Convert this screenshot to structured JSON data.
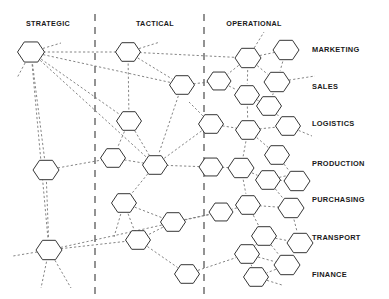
{
  "diagram": {
    "type": "hexagon-network-matrix",
    "title_visible": false,
    "background_color": "#ffffff",
    "node_stroke_color": "#2b2b2b",
    "node_fill_color": "#ffffff",
    "edge_color": "#6e6e6e",
    "divider_color": "#3a3a3a",
    "label_color": "#1a1a1a",
    "column_labels": [
      {
        "id": "strategic",
        "text": "STRATEGIC",
        "x": 48,
        "y": 26
      },
      {
        "id": "tactical",
        "text": "TACTICAL",
        "x": 155,
        "y": 26
      },
      {
        "id": "operational",
        "text": "OPERATIONAL",
        "x": 254,
        "y": 26
      }
    ],
    "row_labels": [
      {
        "id": "marketing",
        "text": "MARKETING",
        "x": 312,
        "y": 52
      },
      {
        "id": "sales",
        "text": "SALES",
        "x": 312,
        "y": 89
      },
      {
        "id": "logistics",
        "text": "LOGISTICS",
        "x": 312,
        "y": 126
      },
      {
        "id": "production",
        "text": "PRODUCTION",
        "x": 312,
        "y": 166
      },
      {
        "id": "purchasing",
        "text": "PURCHASING",
        "x": 312,
        "y": 202
      },
      {
        "id": "transport",
        "text": "TRANSPORT",
        "x": 312,
        "y": 240
      },
      {
        "id": "finance",
        "text": "FINANCE",
        "x": 312,
        "y": 277
      }
    ],
    "dividers": [
      {
        "id": "divider-strategic-tactical",
        "x": 95,
        "y1": 14,
        "y2": 296
      },
      {
        "id": "divider-tactical-operational",
        "x": 204,
        "y1": 14,
        "y2": 296
      }
    ],
    "nodes": [
      {
        "id": "n1",
        "x": 31,
        "y": 52,
        "r": 13.5,
        "zone": "strategic"
      },
      {
        "id": "n2",
        "x": 46,
        "y": 170,
        "r": 13.0,
        "zone": "strategic"
      },
      {
        "id": "n3",
        "x": 49,
        "y": 250,
        "r": 13.0,
        "zone": "strategic"
      },
      {
        "id": "n4",
        "x": 128,
        "y": 52,
        "r": 12.5,
        "zone": "tactical"
      },
      {
        "id": "n5",
        "x": 182,
        "y": 85,
        "r": 12.5,
        "zone": "tactical"
      },
      {
        "id": "n6",
        "x": 129,
        "y": 121,
        "r": 12.5,
        "zone": "tactical"
      },
      {
        "id": "n7",
        "x": 113,
        "y": 158,
        "r": 12.5,
        "zone": "tactical"
      },
      {
        "id": "n8",
        "x": 155,
        "y": 165,
        "r": 12.5,
        "zone": "tactical"
      },
      {
        "id": "n9",
        "x": 124,
        "y": 203,
        "r": 12.5,
        "zone": "tactical"
      },
      {
        "id": "n10",
        "x": 173,
        "y": 222,
        "r": 12.5,
        "zone": "tactical"
      },
      {
        "id": "n11",
        "x": 138,
        "y": 240,
        "r": 12.5,
        "zone": "tactical"
      },
      {
        "id": "n12",
        "x": 187,
        "y": 274,
        "r": 12.5,
        "zone": "tactical"
      },
      {
        "id": "n13",
        "x": 248,
        "y": 58,
        "r": 13.0,
        "zone": "operational"
      },
      {
        "id": "n14",
        "x": 286,
        "y": 50,
        "r": 13.0,
        "zone": "operational"
      },
      {
        "id": "n15",
        "x": 219,
        "y": 81,
        "r": 12.0,
        "zone": "operational"
      },
      {
        "id": "n16",
        "x": 277,
        "y": 82,
        "r": 13.0,
        "zone": "operational"
      },
      {
        "id": "n17",
        "x": 247,
        "y": 95,
        "r": 12.5,
        "zone": "operational"
      },
      {
        "id": "n18",
        "x": 269,
        "y": 106,
        "r": 12.5,
        "zone": "operational"
      },
      {
        "id": "n19",
        "x": 211,
        "y": 124,
        "r": 12.5,
        "zone": "operational"
      },
      {
        "id": "n20",
        "x": 248,
        "y": 130,
        "r": 12.5,
        "zone": "operational"
      },
      {
        "id": "n21",
        "x": 288,
        "y": 126,
        "r": 12.5,
        "zone": "operational"
      },
      {
        "id": "n22",
        "x": 277,
        "y": 155,
        "r": 12.5,
        "zone": "operational"
      },
      {
        "id": "n23",
        "x": 211,
        "y": 167,
        "r": 12.0,
        "zone": "operational"
      },
      {
        "id": "n24",
        "x": 241,
        "y": 168,
        "r": 13.0,
        "zone": "operational"
      },
      {
        "id": "n25",
        "x": 268,
        "y": 180,
        "r": 12.5,
        "zone": "operational"
      },
      {
        "id": "n26",
        "x": 297,
        "y": 181,
        "r": 13.0,
        "zone": "operational"
      },
      {
        "id": "n27",
        "x": 248,
        "y": 205,
        "r": 12.5,
        "zone": "operational"
      },
      {
        "id": "n28",
        "x": 291,
        "y": 208,
        "r": 13.0,
        "zone": "operational"
      },
      {
        "id": "n29",
        "x": 221,
        "y": 212,
        "r": 12.0,
        "zone": "operational"
      },
      {
        "id": "n30",
        "x": 264,
        "y": 236,
        "r": 12.5,
        "zone": "operational"
      },
      {
        "id": "n31",
        "x": 300,
        "y": 243,
        "r": 13.0,
        "zone": "operational"
      },
      {
        "id": "n32",
        "x": 247,
        "y": 254,
        "r": 12.5,
        "zone": "operational"
      },
      {
        "id": "n33",
        "x": 287,
        "y": 265,
        "r": 13.0,
        "zone": "operational"
      },
      {
        "id": "n34",
        "x": 256,
        "y": 277,
        "r": 12.5,
        "zone": "operational"
      }
    ],
    "edges": [
      [
        "n1",
        "n4"
      ],
      [
        "n1",
        "n6"
      ],
      [
        "n1",
        "n2"
      ],
      [
        "n1",
        "n3"
      ],
      [
        "n1",
        "n8"
      ],
      [
        "n1",
        "n5"
      ],
      [
        "n4",
        "n6"
      ],
      [
        "n4",
        "n5"
      ],
      [
        "n4",
        "n13"
      ],
      [
        "n5",
        "n8"
      ],
      [
        "n5",
        "n15"
      ],
      [
        "n6",
        "n7"
      ],
      [
        "n6",
        "n8"
      ],
      [
        "n2",
        "n7"
      ],
      [
        "n2",
        "n3"
      ],
      [
        "n7",
        "n8"
      ],
      [
        "n8",
        "n9"
      ],
      [
        "n8",
        "n19"
      ],
      [
        "n8",
        "n23"
      ],
      [
        "n9",
        "n11"
      ],
      [
        "n9",
        "n10"
      ],
      [
        "n10",
        "n11"
      ],
      [
        "n10",
        "n29"
      ],
      [
        "n3",
        "n11"
      ],
      [
        "n3",
        "n29"
      ],
      [
        "n11",
        "n12"
      ],
      [
        "n12",
        "n32"
      ],
      [
        "n13",
        "n14"
      ],
      [
        "n13",
        "n15"
      ],
      [
        "n13",
        "n16"
      ],
      [
        "n13",
        "n17"
      ],
      [
        "n14",
        "n16"
      ],
      [
        "n15",
        "n17"
      ],
      [
        "n16",
        "n18"
      ],
      [
        "n17",
        "n18"
      ],
      [
        "n17",
        "n20"
      ],
      [
        "n18",
        "n21"
      ],
      [
        "n19",
        "n20"
      ],
      [
        "n20",
        "n21"
      ],
      [
        "n20",
        "n22"
      ],
      [
        "n20",
        "n24"
      ],
      [
        "n22",
        "n26"
      ],
      [
        "n23",
        "n24"
      ],
      [
        "n24",
        "n25"
      ],
      [
        "n24",
        "n27"
      ],
      [
        "n25",
        "n26"
      ],
      [
        "n25",
        "n28"
      ],
      [
        "n27",
        "n28"
      ],
      [
        "n27",
        "n29"
      ],
      [
        "n27",
        "n30"
      ],
      [
        "n30",
        "n31"
      ],
      [
        "n30",
        "n32"
      ],
      [
        "n30",
        "n33"
      ],
      [
        "n32",
        "n33"
      ],
      [
        "n32",
        "n34"
      ],
      [
        "n33",
        "n34"
      ],
      [
        "n28",
        "n31"
      ]
    ],
    "stub_edges": [
      {
        "id": "s1",
        "from": "n1",
        "dx": 30,
        "dy": -9
      },
      {
        "id": "s2",
        "from": "n1",
        "dx": -14,
        "dy": 26
      },
      {
        "id": "s3",
        "from": "n3",
        "dx": -36,
        "dy": 6
      },
      {
        "id": "s4",
        "from": "n3",
        "dx": -8,
        "dy": 38
      },
      {
        "id": "s5",
        "from": "n3",
        "dx": 22,
        "dy": 38
      },
      {
        "id": "s6",
        "from": "n4",
        "dx": 32,
        "dy": -10
      },
      {
        "id": "s7",
        "from": "n9",
        "dx": -10,
        "dy": 34
      },
      {
        "id": "s8",
        "from": "n13",
        "dx": 16,
        "dy": -26
      },
      {
        "id": "s9",
        "from": "n16",
        "dx": 38,
        "dy": -6
      },
      {
        "id": "s10",
        "from": "n21",
        "dx": 24,
        "dy": 10
      },
      {
        "id": "s11",
        "from": "n25",
        "dx": 26,
        "dy": -6
      },
      {
        "id": "s12",
        "from": "n34",
        "dx": 26,
        "dy": 8
      },
      {
        "id": "s13",
        "from": "n19",
        "dx": -22,
        "dy": -22
      }
    ]
  }
}
